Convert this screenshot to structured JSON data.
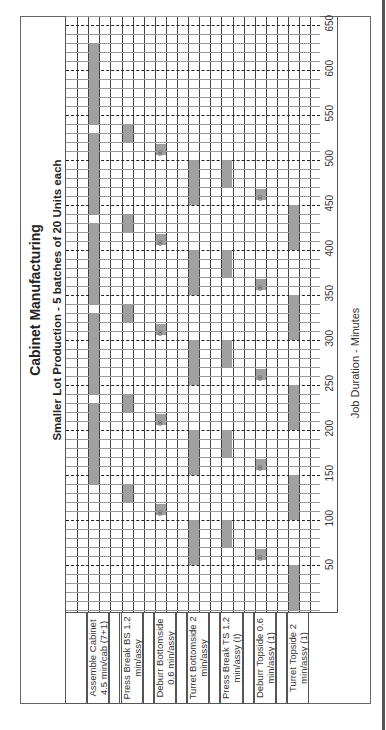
{
  "chart_data": {
    "type": "gantt",
    "title": "Cabinet Manufacturing",
    "subtitle": "Smaller Lot Production - 5 batches of 20 Units each",
    "xlabel": "Job Duration - Minutes",
    "xlim": [
      0,
      650
    ],
    "ticks": [
      50,
      100,
      150,
      200,
      250,
      300,
      350,
      400,
      450,
      500,
      550,
      600,
      650
    ],
    "grid": {
      "minor_step": 10,
      "major_step": 50,
      "major_style": "dashed"
    },
    "orientation": "rotated 90 degrees counter-clockwise",
    "tasks": [
      {
        "label": "Assemble Cabinet 4.5 min/cab (7+1)",
        "line1": "Assemble Cabinet",
        "line2": "4.5 min/cab (7+1)",
        "col": 2,
        "segments": [
          [
            140,
            230
          ],
          [
            240,
            330
          ],
          [
            340,
            430
          ],
          [
            440,
            530
          ],
          [
            540,
            630
          ]
        ]
      },
      {
        "label": "Press Break BS 1.2 min/assy",
        "line1": "Press Break BS 1.2",
        "line2": "min/assy",
        "col": 5,
        "segments": [
          [
            120,
            140
          ],
          [
            220,
            240
          ],
          [
            320,
            340
          ],
          [
            420,
            440
          ],
          [
            520,
            540
          ]
        ]
      },
      {
        "label": "Deburr Bottomside 0.6 min/assy",
        "line1": "Deburr Bottomside",
        "line2": "0.6 min/assy",
        "col": 8,
        "segments": [
          [
            106,
            118
          ],
          [
            206,
            218
          ],
          [
            306,
            318
          ],
          [
            406,
            418
          ],
          [
            506,
            518
          ]
        ],
        "tag": "00"
      },
      {
        "label": "Turret Bottomside 2 min/assy",
        "line1": "Turret Bottomside 2",
        "line2": "min/assy",
        "col": 11,
        "segments": [
          [
            50,
            100
          ],
          [
            150,
            200
          ],
          [
            250,
            300
          ],
          [
            350,
            400
          ],
          [
            450,
            500
          ]
        ]
      },
      {
        "label": "Press Break TS 1.2 min/assy (I)",
        "line1": "Press Break TS 1.2",
        "line2": "min/assy (I)",
        "col": 14,
        "segments": [
          [
            70,
            100
          ],
          [
            170,
            200
          ],
          [
            270,
            300
          ],
          [
            370,
            400
          ],
          [
            470,
            500
          ]
        ]
      },
      {
        "label": "Deburr Topside 0.6 min/assy (1)",
        "line1": "Deburr Topside 0.6",
        "line2": "min/assy (1)",
        "col": 17,
        "segments": [
          [
            56,
            68
          ],
          [
            156,
            168
          ],
          [
            256,
            268
          ],
          [
            356,
            368
          ],
          [
            456,
            468
          ]
        ],
        "tag": "00"
      },
      {
        "label": "Turret Topside 2 min/assy (1)",
        "line1": "Turret Topside 2",
        "line2": "min/assy (1)",
        "col": 20,
        "segments": [
          [
            0,
            50
          ],
          [
            100,
            150
          ],
          [
            200,
            250
          ],
          [
            300,
            350
          ],
          [
            400,
            450
          ]
        ]
      }
    ],
    "colors": {
      "bar": "#a0a0a0",
      "grid": "#444444",
      "dash": "#222222"
    }
  }
}
